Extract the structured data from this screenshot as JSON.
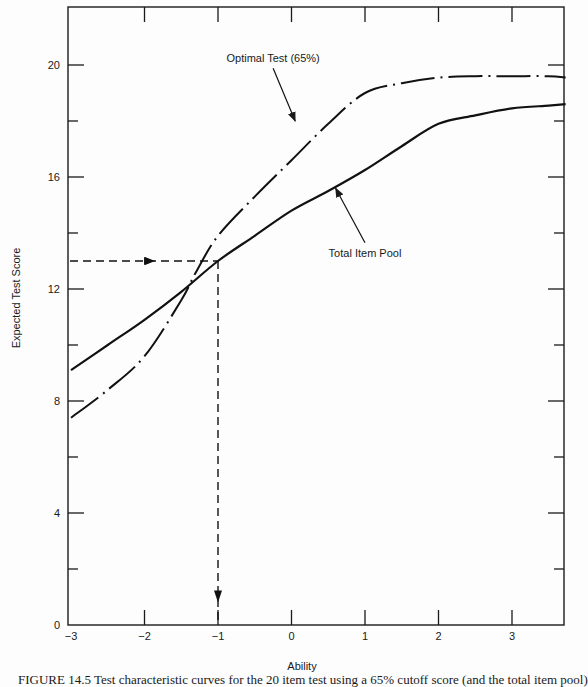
{
  "chart_data": {
    "type": "line",
    "title": "",
    "xlabel": "Ability",
    "ylabel": "Expected Test Score",
    "xlim": [
      -3,
      3.73
    ],
    "ylim": [
      0,
      21.9
    ],
    "grid": false,
    "x_ticks": [
      -3,
      -2,
      -1,
      0,
      1,
      2,
      3
    ],
    "x_tick_labels": [
      "−3",
      "−2",
      "−1",
      "0",
      "1",
      "2",
      "3"
    ],
    "y_ticks_major": [
      0,
      4,
      8,
      12,
      16,
      20
    ],
    "y_tick_labels": [
      "0",
      "4",
      "8",
      "12",
      "16",
      "20"
    ],
    "y_ticks_minor": [
      2,
      6,
      10,
      14,
      18
    ],
    "series": [
      {
        "name": "Total Item Pool",
        "style": "solid",
        "x": [
          -3,
          -2.5,
          -2,
          -1.5,
          -1,
          -0.5,
          0,
          0.5,
          1,
          1.5,
          2,
          2.5,
          3,
          3.5,
          3.73
        ],
        "y": [
          9.1,
          10.0,
          10.9,
          11.9,
          13.0,
          13.9,
          14.8,
          15.5,
          16.25,
          17.1,
          17.9,
          18.2,
          18.45,
          18.55,
          18.6
        ]
      },
      {
        "name": "Optimal Test (65%)",
        "style": "dash-dot",
        "x": [
          -3,
          -2.5,
          -2,
          -1.5,
          -1.3,
          -1,
          -0.5,
          0,
          0.5,
          1,
          1.5,
          2,
          2.5,
          3,
          3.5,
          3.73
        ],
        "y": [
          7.4,
          8.4,
          9.6,
          11.6,
          12.6,
          13.9,
          15.3,
          16.6,
          17.9,
          19.0,
          19.35,
          19.55,
          19.6,
          19.6,
          19.6,
          19.55
        ]
      }
    ],
    "annotations": [
      {
        "text": "Optimal Test (65%)",
        "x": -0.25,
        "y": 20.1,
        "arrow_to": [
          0.05,
          18.0
        ]
      },
      {
        "text": "Total Item Pool",
        "x": 1.0,
        "y": 13.15,
        "arrow_to": [
          0.6,
          15.6
        ]
      },
      {
        "text": "cutoff score line",
        "type": "dashed-arrow",
        "from": [
          -3,
          13.0
        ],
        "corner": [
          -1,
          13.0
        ],
        "to": [
          -1,
          0.8
        ]
      }
    ],
    "legend": "none (inline annotations)"
  },
  "caption": "FIGURE 14.5 Test characteristic curves for the 20 item test using a 65% cutoff score (and the total item pool)"
}
